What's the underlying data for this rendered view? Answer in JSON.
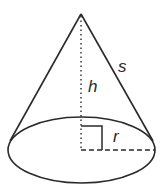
{
  "diagram": {
    "labels": {
      "slant_height": "s",
      "height": "h",
      "radius": "r"
    },
    "colors": {
      "stroke": "#2a2a2a",
      "background": "#ffffff"
    }
  }
}
